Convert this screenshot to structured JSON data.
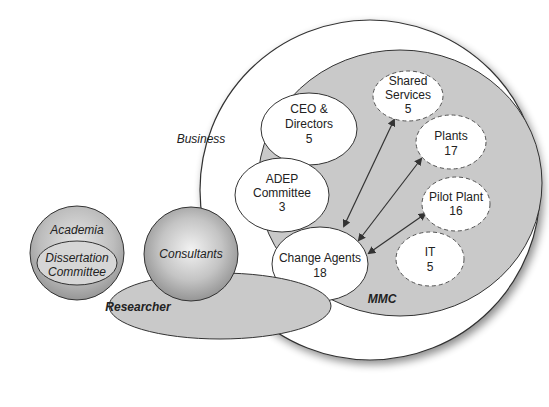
{
  "diagram": {
    "type": "nested-ellipse stakeholder diagram",
    "colors": {
      "background": "#ffffff",
      "mmc_fill": "#c8c8c8",
      "researcher_fill": "#c8c8c8",
      "sphere_fill": "#b8b8b8",
      "node_fill": "#ffffff",
      "stroke": "#333333"
    },
    "outer": {
      "label": "Business"
    },
    "organization": {
      "label": "MMC"
    },
    "nodes": {
      "ceo": {
        "line1": "CEO &",
        "line2": "Directors",
        "count": "5",
        "border": "solid"
      },
      "adep": {
        "line1": "ADEP",
        "line2": "Committee",
        "count": "3",
        "border": "solid"
      },
      "change_agents": {
        "line1": "Change Agents",
        "count": "18",
        "border": "solid"
      },
      "shared_services": {
        "line1": "Shared",
        "line2": "Services",
        "count": "5",
        "border": "dashed"
      },
      "plants": {
        "line1": "Plants",
        "count": "17",
        "border": "dashed"
      },
      "pilot_plant": {
        "line1": "Pilot Plant",
        "count": "16",
        "border": "dashed"
      },
      "it": {
        "line1": "IT",
        "count": "5",
        "border": "dashed"
      }
    },
    "external": {
      "academia": {
        "label": "Academia"
      },
      "dissertation": {
        "line1": "Dissertation",
        "line2": "Committee"
      },
      "consultants": {
        "label": "Consultants"
      },
      "researcher": {
        "label": "Researcher"
      }
    },
    "links": [
      {
        "from": "Change Agents",
        "to": "Shared Services",
        "type": "bidirectional"
      },
      {
        "from": "Change Agents",
        "to": "Plants",
        "type": "bidirectional"
      },
      {
        "from": "Change Agents",
        "to": "Pilot Plant",
        "type": "bidirectional"
      }
    ]
  }
}
